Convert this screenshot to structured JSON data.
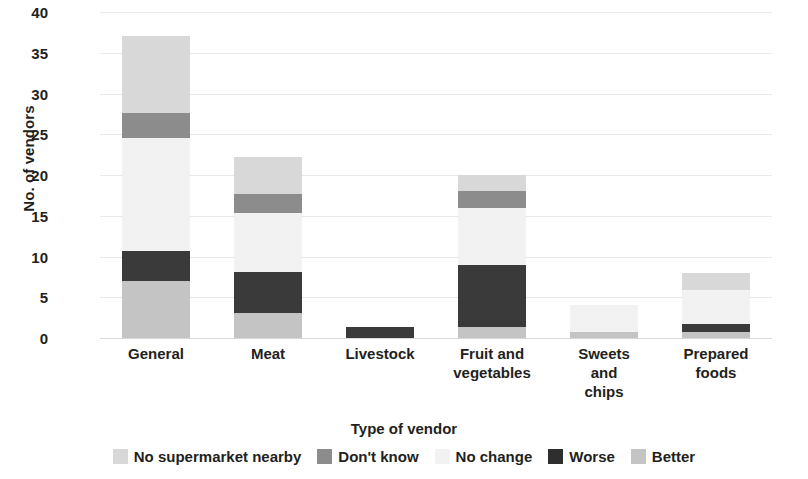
{
  "chart_data": {
    "type": "bar",
    "stacked": true,
    "title": "",
    "subtitle": "",
    "xlabel": "Type of vendor",
    "ylabel": "No. of vendors",
    "ylim": [
      0,
      40
    ],
    "ytick_step": 5,
    "ytick_labels": [
      "40",
      "35",
      "30",
      "25",
      "20",
      "15",
      "10",
      "5",
      "0"
    ],
    "grid": true,
    "grid_axis": "y",
    "legend_position": "bottom",
    "categories": [
      "General",
      "Meat",
      "Livestock",
      "Fruit and vegetables",
      "Sweets and chips",
      "Prepared foods"
    ],
    "category_label_lines": [
      [
        "General"
      ],
      [
        "Meat"
      ],
      [
        "Livestock"
      ],
      [
        "Fruit and",
        "vegetables"
      ],
      [
        "Sweets",
        "and",
        "chips"
      ],
      [
        "Prepared",
        "foods"
      ]
    ],
    "series": [
      {
        "name": "Better",
        "color": "#c4c4c4",
        "values": [
          7,
          3.1,
          0,
          1.3,
          0.7,
          0.7
        ]
      },
      {
        "name": "Worse",
        "color": "#3a3a3a",
        "values": [
          3.7,
          5.0,
          1.4,
          7.7,
          0,
          1.0
        ]
      },
      {
        "name": "No change",
        "color": "#f2f2f2",
        "values": [
          13.8,
          7.2,
          0,
          7.0,
          3.3,
          4.2
        ]
      },
      {
        "name": "Don't know",
        "color": "#8c8c8c",
        "values": [
          3.1,
          2.4,
          0,
          2.0,
          0,
          0
        ]
      },
      {
        "name": "No supermarket nearby",
        "color": "#d8d8d8",
        "values": [
          9.4,
          4.5,
          0,
          2.0,
          0,
          2.1
        ]
      }
    ],
    "totals": [
      37,
      22.2,
      1.4,
      20,
      4,
      8
    ],
    "legend": [
      {
        "label": "No supermarket nearby",
        "color": "#d8d8d8"
      },
      {
        "label": "Don't know",
        "color": "#8c8c8c"
      },
      {
        "label": "No change",
        "color": "#f2f2f2"
      },
      {
        "label": "Worse",
        "color": "#2e2e2e"
      },
      {
        "label": "Better",
        "color": "#c4c4c4"
      }
    ]
  }
}
